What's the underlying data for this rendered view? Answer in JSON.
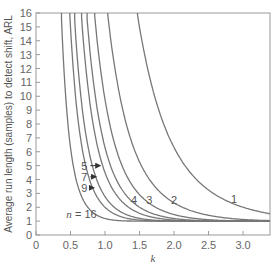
{
  "chart_data": {
    "type": "line",
    "title": "",
    "xlabel": "k",
    "ylabel": "Average run length (samples) to detect shift, ARL",
    "xlim": [
      0,
      3.39
    ],
    "ylim": [
      0,
      16
    ],
    "xticks": [
      0,
      0.5,
      1.0,
      1.5,
      2.0,
      2.5,
      3.0
    ],
    "xtick_labels": [
      "0",
      "0.5",
      "1.0",
      "1.5",
      "2.0",
      "2.5",
      "3.0"
    ],
    "yticks": [
      0,
      1,
      2,
      3,
      4,
      5,
      6,
      7,
      8,
      9,
      10,
      11,
      12,
      13,
      14,
      15,
      16
    ],
    "ytick_labels": [
      "0",
      "1",
      "2",
      "3",
      "4",
      "5",
      "6",
      "7",
      "8",
      "9",
      "10",
      "11",
      "12",
      "13",
      "14",
      "15",
      "16"
    ],
    "grid": false,
    "legend": "inline labels",
    "x": [
      0.4,
      0.5,
      0.6,
      0.7,
      0.8,
      0.9,
      1.0,
      1.1,
      1.2,
      1.3,
      1.4,
      1.5,
      1.6,
      1.7,
      1.8,
      1.9,
      2.0,
      2.1,
      2.2,
      2.3,
      2.4,
      2.5,
      2.6,
      2.7,
      2.8,
      2.9,
      3.0,
      3.1,
      3.2,
      3.3,
      3.39
    ],
    "series": [
      {
        "name": "1",
        "n": 1,
        "values": [
          null,
          null,
          null,
          null,
          null,
          null,
          null,
          null,
          null,
          null,
          null,
          15.9,
          13.1,
          10.4,
          8.5,
          7.3,
          6.3,
          5.2,
          4.4,
          3.8,
          3.3,
          2.9,
          2.6,
          2.3,
          2.1,
          1.9,
          1.8,
          1.7,
          1.6,
          1.55,
          1.5
        ]
      },
      {
        "name": "2",
        "n": 2,
        "values": [
          null,
          null,
          null,
          null,
          null,
          null,
          null,
          null,
          15.5,
          11.5,
          8.7,
          6.7,
          5.2,
          4.2,
          3.4,
          2.8,
          2.4,
          2.1,
          1.8,
          1.6,
          1.5,
          1.35,
          1.25,
          1.2,
          1.1,
          1.1,
          1.05,
          1.03,
          1.02,
          1.01,
          1.0
        ]
      },
      {
        "name": "3",
        "n": 3,
        "values": [
          null,
          null,
          null,
          null,
          null,
          null,
          null,
          14.3,
          10.2,
          7.4,
          5.5,
          4.2,
          3.3,
          2.6,
          2.1,
          1.8,
          1.55,
          1.4,
          1.25,
          1.15,
          1.1,
          1.05,
          1.03,
          1.02,
          1.01,
          1.0,
          1.0,
          1.0,
          1.0,
          1.0,
          1.0
        ]
      },
      {
        "name": "4",
        "n": 4,
        "values": [
          null,
          null,
          null,
          null,
          null,
          null,
          15.9,
          11.1,
          7.9,
          5.7,
          4.2,
          3.2,
          2.5,
          2.0,
          1.7,
          1.45,
          1.3,
          1.17,
          1.1,
          1.05,
          1.03,
          1.01,
          1.0,
          1.0,
          1.0,
          1.0,
          1.0,
          1.0,
          1.0,
          1.0,
          1.0
        ]
      },
      {
        "name": "5",
        "n": 5,
        "values": [
          null,
          null,
          null,
          null,
          null,
          null,
          12.5,
          8.7,
          6.1,
          4.4,
          3.2,
          2.5,
          2.0,
          1.6,
          1.35,
          1.2,
          1.1,
          1.05,
          1.02,
          1.01,
          1.0,
          1.0,
          1.0,
          1.0,
          1.0,
          1.0,
          1.0,
          1.0,
          1.0,
          1.0,
          1.0
        ]
      },
      {
        "name": "7",
        "n": 7,
        "values": [
          null,
          null,
          null,
          null,
          null,
          14.1,
          9.6,
          6.6,
          4.7,
          3.4,
          2.5,
          1.9,
          1.5,
          1.3,
          1.15,
          1.07,
          1.03,
          1.01,
          1.0,
          1.0,
          1.0,
          1.0,
          1.0,
          1.0,
          1.0,
          1.0,
          1.0,
          1.0,
          1.0,
          1.0,
          1.0
        ]
      },
      {
        "name": "9",
        "n": 9,
        "values": [
          null,
          null,
          null,
          null,
          15.9,
          10.8,
          7.4,
          5.2,
          3.7,
          2.7,
          2.0,
          1.6,
          1.3,
          1.15,
          1.07,
          1.03,
          1.01,
          1.0,
          1.0,
          1.0,
          1.0,
          1.0,
          1.0,
          1.0,
          1.0,
          1.0,
          1.0,
          1.0,
          1.0,
          1.0,
          1.0
        ]
      },
      {
        "name": "n = 16",
        "n": 16,
        "values": [
          null,
          null,
          14.9,
          9.5,
          6.3,
          4.3,
          3.0,
          2.2,
          1.7,
          1.4,
          1.2,
          1.08,
          1.03,
          1.01,
          1.0,
          1.0,
          1.0,
          1.0,
          1.0,
          1.0,
          1.0,
          1.0,
          1.0,
          1.0,
          1.0,
          1.0,
          1.0,
          1.0,
          1.0,
          1.0,
          1.0
        ]
      }
    ],
    "n_values": [
      1,
      2,
      3,
      4,
      5,
      7,
      9,
      16
    ],
    "annotations": [
      {
        "text": "1",
        "k": 2.87,
        "arl": 2.6
      },
      {
        "text": "2",
        "k": 2.0,
        "arl": 2.5
      },
      {
        "text": "3",
        "k": 1.64,
        "arl": 2.5
      },
      {
        "text": "4",
        "k": 1.42,
        "arl": 2.5
      },
      {
        "text": "5",
        "k": 0.7,
        "arl": 5.0,
        "arrow_to_k": 0.93
      },
      {
        "text": "7",
        "k": 0.7,
        "arl": 4.2,
        "arrow_to_k": 0.87
      },
      {
        "text": "9",
        "k": 0.7,
        "arl": 3.4,
        "arrow_to_k": 0.84
      },
      {
        "text": "n = 16",
        "k": 0.44,
        "arl": 1.5
      }
    ]
  },
  "colors": {
    "curve": "#777777",
    "axis": "#999999",
    "text": "#555555"
  }
}
